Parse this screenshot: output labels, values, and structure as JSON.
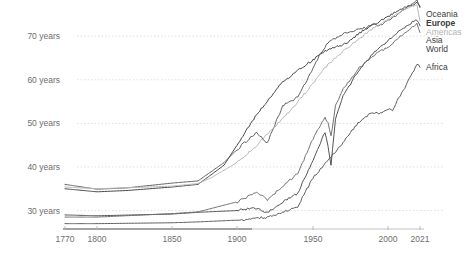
{
  "chart_data": {
    "type": "line",
    "title": "",
    "xlabel": "",
    "ylabel": "",
    "xlim": [
      1770,
      2021
    ],
    "ylim": [
      26,
      76
    ],
    "grid": true,
    "legend_position": "right-inline",
    "x_ticks": [
      1770,
      1800,
      1850,
      1900,
      1950,
      2000,
      2021
    ],
    "x_tick_labels": [
      "1770",
      "1800",
      "1850",
      "1900",
      "1950",
      "2000",
      "2021"
    ],
    "y_ticks": [
      30,
      40,
      50,
      60,
      70
    ],
    "y_tick_labels": [
      "30 years",
      "40 years",
      "50 years",
      "60 years",
      "70 years"
    ],
    "series": [
      {
        "name": "Oceania",
        "color": "#3d3d3d",
        "label_color": "#3d3d3d",
        "x": [
          1770,
          1800,
          1820,
          1850,
          1870,
          1890,
          1900,
          1913,
          1920,
          1930,
          1940,
          1950,
          1955,
          1960,
          1965,
          1970,
          1975,
          1980,
          1985,
          1990,
          1995,
          2000,
          2005,
          2010,
          2015,
          2019,
          2021
        ],
        "values": [
          35.0,
          34.3,
          34.6,
          35.4,
          36.0,
          40.4,
          45.0,
          52.0,
          55.0,
          59.5,
          62.2,
          64.5,
          66.0,
          67.0,
          67.5,
          68.0,
          69.0,
          70.5,
          71.6,
          72.6,
          73.5,
          74.5,
          75.5,
          76.4,
          77.0,
          77.6,
          77.0
        ]
      },
      {
        "name": "Europe",
        "color": "#5a5a5a",
        "label_color": "#3d3d3d",
        "x": [
          1770,
          1800,
          1820,
          1850,
          1870,
          1890,
          1900,
          1913,
          1920,
          1930,
          1940,
          1950,
          1955,
          1960,
          1965,
          1970,
          1975,
          1980,
          1985,
          1990,
          1995,
          2000,
          2005,
          2010,
          2015,
          2019,
          2021
        ],
        "values": [
          36.0,
          34.9,
          35.2,
          36.3,
          36.8,
          41.0,
          44.0,
          48.0,
          45.5,
          54.0,
          56.0,
          62.5,
          66.0,
          68.5,
          69.5,
          70.5,
          71.0,
          71.5,
          72.0,
          72.6,
          72.5,
          73.6,
          74.6,
          76.0,
          77.3,
          78.3,
          76.5
        ]
      },
      {
        "name": "Americas",
        "color": "#b9b9b9",
        "label_color": "#b4b4b4",
        "x": [
          1770,
          1800,
          1850,
          1870,
          1880,
          1900,
          1913,
          1920,
          1930,
          1940,
          1950,
          1955,
          1960,
          1965,
          1970,
          1975,
          1980,
          1985,
          1990,
          1995,
          2000,
          2005,
          2010,
          2015,
          2019,
          2021
        ],
        "values": [
          35.4,
          35.0,
          35.6,
          36.2,
          37.5,
          41.0,
          45.0,
          47.5,
          51.0,
          55.0,
          59.0,
          61.5,
          63.5,
          65.0,
          66.5,
          67.8,
          69.2,
          70.5,
          71.8,
          72.8,
          73.8,
          75.0,
          76.0,
          76.8,
          77.3,
          73.5
        ]
      },
      {
        "name": "Asia",
        "color": "#4a4a4a",
        "label_color": "#3d3d3d",
        "x": [
          1770,
          1800,
          1850,
          1870,
          1900,
          1913,
          1920,
          1930,
          1940,
          1950,
          1955,
          1958,
          1960,
          1962,
          1965,
          1970,
          1975,
          1980,
          1985,
          1990,
          1995,
          2000,
          2005,
          2010,
          2015,
          2019,
          2021
        ],
        "values": [
          29.0,
          28.8,
          29.2,
          29.6,
          30.0,
          30.6,
          29.5,
          32.0,
          34.0,
          41.5,
          45.5,
          48.0,
          45.0,
          40.5,
          51.0,
          56.5,
          59.0,
          62.0,
          64.0,
          66.0,
          67.5,
          69.0,
          70.5,
          71.8,
          73.0,
          73.8,
          72.5
        ]
      },
      {
        "name": "World",
        "color": "#6b6b6b",
        "label_color": "#3d3d3d",
        "x": [
          1770,
          1800,
          1850,
          1870,
          1900,
          1913,
          1920,
          1930,
          1940,
          1950,
          1955,
          1958,
          1960,
          1962,
          1965,
          1970,
          1975,
          1980,
          1985,
          1990,
          1995,
          2000,
          2005,
          2010,
          2015,
          2019,
          2021
        ],
        "values": [
          28.5,
          28.5,
          29.3,
          29.7,
          32.0,
          34.1,
          32.5,
          35.5,
          38.5,
          46.5,
          49.5,
          51.5,
          50.0,
          47.0,
          54.0,
          58.0,
          60.0,
          62.5,
          64.0,
          65.5,
          66.5,
          67.5,
          69.0,
          70.5,
          71.8,
          72.8,
          71.0
        ]
      },
      {
        "name": "Africa",
        "color": "#555555",
        "label_color": "#3d3d3d",
        "x": [
          1770,
          1800,
          1850,
          1870,
          1900,
          1913,
          1920,
          1930,
          1940,
          1950,
          1955,
          1960,
          1965,
          1970,
          1975,
          1980,
          1985,
          1990,
          1995,
          2000,
          2003,
          2005,
          2010,
          2015,
          2019,
          2021
        ],
        "values": [
          27.0,
          27.0,
          27.2,
          27.4,
          27.8,
          28.3,
          28.5,
          29.5,
          31.0,
          37.5,
          39.5,
          41.5,
          43.5,
          45.5,
          48.0,
          50.0,
          51.5,
          52.5,
          52.3,
          53.2,
          53.0,
          54.5,
          57.5,
          61.0,
          63.5,
          63.0
        ]
      }
    ],
    "annotations": [
      {
        "name": "Africa",
        "text": "Africa",
        "x": 2021,
        "y": 63.0
      }
    ]
  },
  "legend": {
    "items": [
      {
        "label": "Oceania"
      },
      {
        "label": "Europe"
      },
      {
        "label": "Americas"
      },
      {
        "label": "Asia"
      },
      {
        "label": "World"
      }
    ],
    "africa_label": "Africa"
  }
}
